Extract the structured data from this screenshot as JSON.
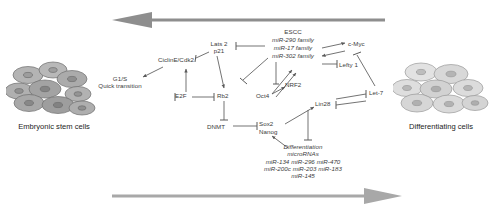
{
  "figure": {
    "type": "pathway-diagram",
    "background": "#ffffff",
    "arrow_color": "#8c8c8c",
    "node_text_color": "#3b3b3b",
    "caption_color": "#1d1d1d",
    "cell_fill": "#a8a8a8",
    "cell_nucleus": "#7e7e7e"
  },
  "banners": {
    "top": {
      "name": "reprogramming-direction-arrow",
      "direction": "left"
    },
    "bottom": {
      "name": "differentiation-direction-arrow",
      "direction": "right"
    }
  },
  "captions": {
    "left": "Embryonic stem cells",
    "right": "Differentiating cells"
  },
  "nodes": [
    {
      "id": "g1s",
      "lines": [
        "G1/S",
        "Quick transition"
      ],
      "x": 120,
      "y": 78,
      "italic": false,
      "align": "center"
    },
    {
      "id": "ciclin",
      "lines": [
        "CiclinE/Cdk2"
      ],
      "x": 165,
      "y": 59,
      "italic": false,
      "align": "left"
    },
    {
      "id": "e2f",
      "lines": [
        "E2F"
      ],
      "x": 177,
      "y": 95,
      "italic": false,
      "align": "left"
    },
    {
      "id": "lats2",
      "lines": [
        "Lats 2",
        "p21"
      ],
      "x": 215,
      "y": 43,
      "italic": false,
      "align": "center"
    },
    {
      "id": "rb2",
      "lines": [
        "Rb2"
      ],
      "x": 219,
      "y": 95,
      "italic": false,
      "align": "left"
    },
    {
      "id": "dnmt",
      "lines": [
        "DNMT"
      ],
      "x": 210,
      "y": 128,
      "italic": false,
      "align": "left"
    },
    {
      "id": "escc",
      "lines": [
        "ESCC"
      ],
      "x": 290,
      "y": 31,
      "italic": false,
      "align": "center"
    },
    {
      "id": "mir290",
      "lines": [
        "miR-290 family"
      ],
      "x": 290,
      "y": 39,
      "italic": true,
      "align": "center"
    },
    {
      "id": "mir17",
      "lines": [
        "miR-17 family"
      ],
      "x": 290,
      "y": 47,
      "italic": true,
      "align": "center"
    },
    {
      "id": "mir302",
      "lines": [
        "miR-302 family"
      ],
      "x": 290,
      "y": 55,
      "italic": true,
      "align": "center"
    },
    {
      "id": "cmyc",
      "lines": [
        "c-Myc"
      ],
      "x": 351,
      "y": 44,
      "italic": false,
      "align": "left"
    },
    {
      "id": "lefty1",
      "lines": [
        "Lefty 1"
      ],
      "x": 340,
      "y": 62,
      "italic": false,
      "align": "left"
    },
    {
      "id": "nrf2",
      "lines": [
        "NRF2"
      ],
      "x": 286,
      "y": 84,
      "italic": false,
      "align": "left"
    },
    {
      "id": "oct4",
      "lines": [
        "Oct4"
      ],
      "x": 257,
      "y": 96,
      "italic": false,
      "align": "left"
    },
    {
      "id": "lin28",
      "lines": [
        "Lin28"
      ],
      "x": 317,
      "y": 103,
      "italic": false,
      "align": "left"
    },
    {
      "id": "let7",
      "lines": [
        "Let-7"
      ],
      "x": 371,
      "y": 92,
      "italic": false,
      "align": "left"
    },
    {
      "id": "sox2",
      "lines": [
        "Sox2"
      ],
      "x": 262,
      "y": 123,
      "italic": false,
      "align": "left"
    },
    {
      "id": "nanog",
      "lines": [
        "Nanog"
      ],
      "x": 262,
      "y": 131,
      "italic": false,
      "align": "left"
    },
    {
      "id": "diff1",
      "lines": [
        "Differentiation"
      ],
      "x": 300,
      "y": 146,
      "italic": true,
      "align": "center"
    },
    {
      "id": "diff2",
      "lines": [
        "microRNAs"
      ],
      "x": 300,
      "y": 153,
      "italic": true,
      "align": "center"
    },
    {
      "id": "difflist1",
      "lines": [
        "miR-134 miR-296 miR-470"
      ],
      "x": 300,
      "y": 161,
      "italic": true,
      "align": "center"
    },
    {
      "id": "difflist2",
      "lines": [
        "miR-200c miR-203 miR-183"
      ],
      "x": 300,
      "y": 168,
      "italic": true,
      "align": "center"
    },
    {
      "id": "difflist3",
      "lines": [
        "miR-145"
      ],
      "x": 300,
      "y": 175,
      "italic": true,
      "align": "center"
    }
  ],
  "edges": [
    {
      "from": "ciclin",
      "to": "g1s",
      "kind": "arrow"
    },
    {
      "from": "lats2",
      "to": "ciclin",
      "kind": "bar"
    },
    {
      "from": "lats2",
      "to": "rb2",
      "kind": "arrow"
    },
    {
      "from": "e2f",
      "to": "ciclin",
      "kind": "arrow"
    },
    {
      "from": "e2f",
      "to": "rb2",
      "kind": "bar"
    },
    {
      "from": "escc",
      "to": "lats2",
      "kind": "bar"
    },
    {
      "from": "escc",
      "to": "rb2",
      "kind": "bar"
    },
    {
      "from": "escc",
      "to": "cmyc",
      "kind": "arrow"
    },
    {
      "from": "cmyc",
      "to": "escc",
      "kind": "arrow"
    },
    {
      "from": "escc",
      "to": "lefty1",
      "kind": "bar"
    },
    {
      "from": "rb2",
      "to": "dnmt",
      "kind": "bar"
    },
    {
      "from": "dnmt",
      "to": "sox2",
      "kind": "bar"
    },
    {
      "from": "oct4",
      "to": "escc",
      "kind": "arrow"
    },
    {
      "from": "oct4",
      "to": "nrf2",
      "kind": "arrow"
    },
    {
      "from": "sox2",
      "to": "lin28",
      "kind": "arrow"
    },
    {
      "from": "lin28",
      "to": "let7",
      "kind": "bar"
    },
    {
      "from": "let7",
      "to": "lin28",
      "kind": "bar"
    },
    {
      "from": "cmyc",
      "to": "let7",
      "kind": "bar"
    },
    {
      "from": "lin28",
      "to": "diff1",
      "kind": "bar"
    },
    {
      "from": "diff1",
      "to": "nanog",
      "kind": "arrow"
    }
  ]
}
